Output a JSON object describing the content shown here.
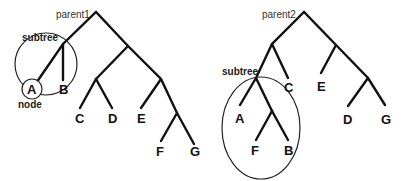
{
  "diagram": {
    "tree1": {
      "label": "parent1",
      "subtree_label": "subtree",
      "node_label": "node",
      "leaves": [
        "A",
        "B",
        "C",
        "D",
        "E",
        "F",
        "G"
      ]
    },
    "tree2": {
      "label": "parent2",
      "subtree_label": "subtree",
      "leaves": [
        "A",
        "F",
        "B",
        "C",
        "E",
        "D",
        "G"
      ]
    }
  }
}
